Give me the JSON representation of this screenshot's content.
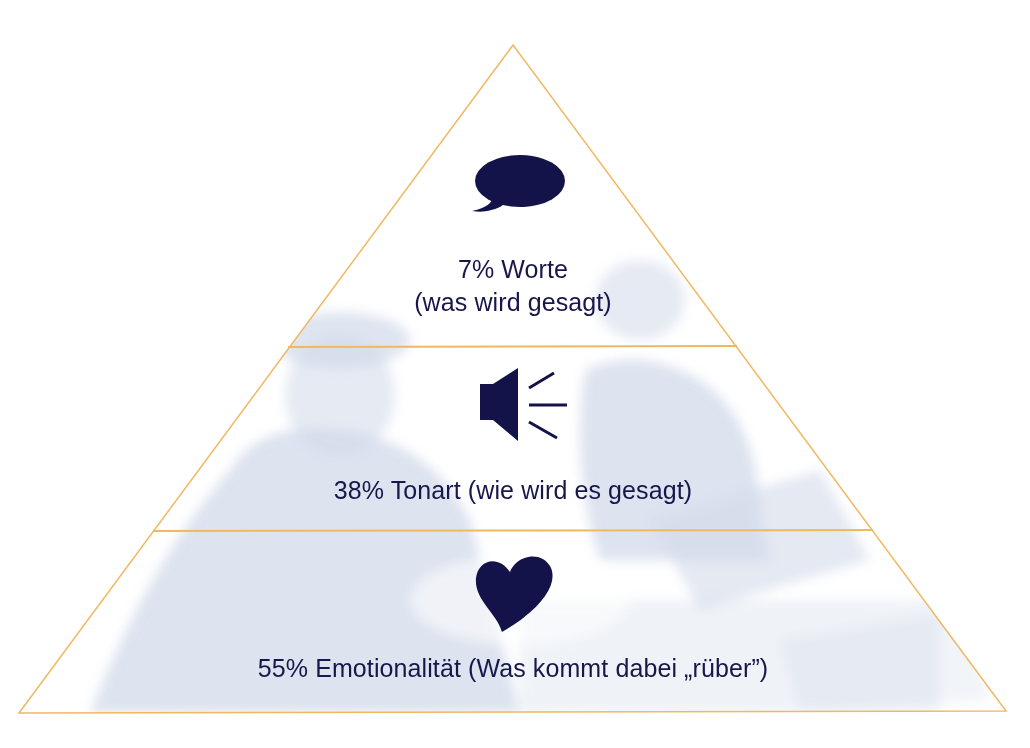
{
  "diagram": {
    "type": "pyramid",
    "colors": {
      "outline": "#f0b860",
      "icon": "#13134a",
      "text": "#17174a",
      "photo_tint": "#c9d3e6",
      "background": "#ffffff"
    },
    "levels": [
      {
        "position": "top",
        "icon": "speech-bubble-icon",
        "percent": "7%",
        "line1": "7% Worte",
        "line2": "(was wird gesagt)"
      },
      {
        "position": "middle",
        "icon": "speaker-icon",
        "percent": "38%",
        "line1": "38% Tonart (wie wird es gesagt)"
      },
      {
        "position": "bottom",
        "icon": "heart-icon",
        "percent": "55%",
        "line1": "55% Emotionalität (Was kommt dabei „rüber”)"
      }
    ]
  }
}
